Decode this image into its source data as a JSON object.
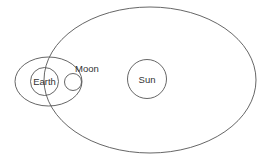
{
  "diagram": {
    "type": "orbit-diagram",
    "stroke_color": "#555555",
    "background": "#ffffff",
    "bodies": {
      "earth": {
        "label": "Earth"
      },
      "moon": {
        "label": "Moon"
      },
      "sun": {
        "label": "Sun"
      }
    },
    "orbits": [
      {
        "name": "earth-orbit-around-sun",
        "around": "Sun",
        "body": "Earth"
      },
      {
        "name": "moon-orbit-around-earth",
        "around": "Earth",
        "body": "Moon"
      }
    ]
  }
}
